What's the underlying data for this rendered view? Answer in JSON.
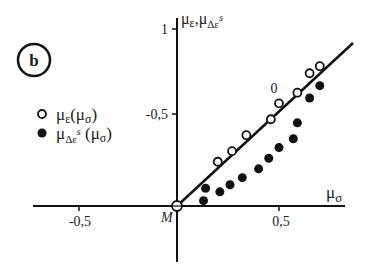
{
  "panel_label": "b",
  "chart_data": {
    "type": "scatter",
    "title": "",
    "xlabel": "μσ",
    "ylabel": "με, μΔεs",
    "x_ticks": [
      {
        "value": -0.5,
        "label": "-0,5"
      },
      {
        "value": 0.5,
        "label": "0,5"
      }
    ],
    "y_ticks": [
      {
        "value": 0.5,
        "label": "-0,5"
      },
      {
        "value": 1,
        "label": "1"
      }
    ],
    "xlim": [
      -0.7,
      0.83
    ],
    "ylim": [
      -0.32,
      1.0
    ],
    "grid": false,
    "legend_position": "left",
    "origin_label": "M",
    "annotation": {
      "text": "0",
      "x": 0.47,
      "y": 0.66
    },
    "series": [
      {
        "name": "με(μσ)",
        "marker": "open-circle",
        "points": [
          [
            0.0,
            0.0
          ],
          [
            0.2,
            0.25
          ],
          [
            0.27,
            0.31
          ],
          [
            0.34,
            0.4
          ],
          [
            0.46,
            0.49
          ],
          [
            0.5,
            0.58
          ],
          [
            0.59,
            0.64
          ],
          [
            0.65,
            0.75
          ],
          [
            0.7,
            0.79
          ]
        ]
      },
      {
        "name": "μΔεs(μσ)",
        "marker": "filled-circle",
        "points": [
          [
            0.13,
            0.03
          ],
          [
            0.14,
            0.1
          ],
          [
            0.21,
            0.08
          ],
          [
            0.26,
            0.12
          ],
          [
            0.32,
            0.16
          ],
          [
            0.4,
            0.21
          ],
          [
            0.45,
            0.27
          ],
          [
            0.5,
            0.33
          ],
          [
            0.57,
            0.38
          ],
          [
            0.59,
            0.47
          ],
          [
            0.65,
            0.61
          ],
          [
            0.7,
            0.68
          ]
        ]
      },
      {
        "name": "reference line",
        "marker": "line",
        "points": [
          [
            0.0,
            0.0
          ],
          [
            0.86,
            0.92
          ]
        ]
      }
    ],
    "legend": [
      {
        "marker": "open-circle",
        "label": "με(μσ)"
      },
      {
        "marker": "filled-circle",
        "label": "μΔεs(μσ)"
      }
    ]
  }
}
